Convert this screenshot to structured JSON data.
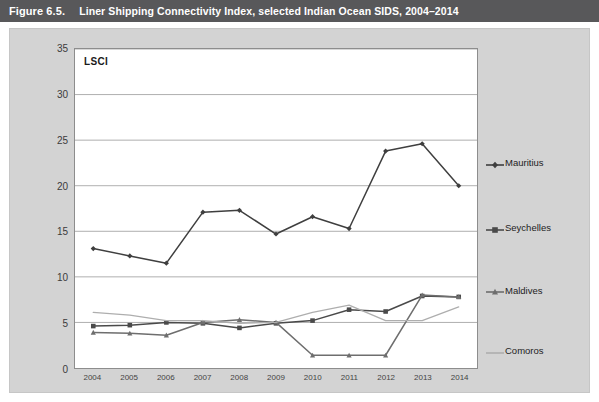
{
  "header": {
    "figure_number": "Figure 6.5.",
    "title": "Liner Shipping Connectivity Index, selected Indian Ocean SIDS, 2004–2014"
  },
  "plot": {
    "corner_label": "LSCI"
  },
  "colors": {
    "header_bar": "#58585a",
    "panel_background": "#d3d3d3",
    "plot_background": "#ffffff",
    "plot_border": "#8d8d8d",
    "gridline": "#9a9a9a",
    "mauritius": "#3f3f3f",
    "seychelles": "#4a4a4a",
    "maldives": "#6e6e6e",
    "comoros": "#aeaeae"
  },
  "chart_data": {
    "type": "line",
    "title": "Liner Shipping Connectivity Index, selected Indian Ocean SIDS, 2004–2014",
    "xlabel": "",
    "ylabel": "LSCI",
    "ylim": [
      0,
      35
    ],
    "yticks": [
      0,
      5,
      10,
      15,
      20,
      25,
      30,
      35
    ],
    "grid": true,
    "legend_position": "right-inline",
    "categories": [
      "2004",
      "2005",
      "2006",
      "2007",
      "2008",
      "2009",
      "2010",
      "2011",
      "2012",
      "2013",
      "2014"
    ],
    "series": [
      {
        "name": "Mauritius",
        "marker": "diamond",
        "values": [
          13.1,
          12.3,
          11.5,
          17.1,
          17.3,
          14.7,
          16.6,
          15.3,
          23.8,
          24.6,
          20.0
        ]
      },
      {
        "name": "Seychelles",
        "marker": "square",
        "values": [
          4.6,
          4.7,
          5.0,
          4.9,
          4.4,
          4.9,
          5.2,
          6.4,
          6.2,
          7.9,
          7.8
        ]
      },
      {
        "name": "Maldives",
        "marker": "triangle",
        "values": [
          3.9,
          3.8,
          3.6,
          5.0,
          5.3,
          5.0,
          1.4,
          1.4,
          1.4,
          8.0,
          7.8
        ]
      },
      {
        "name": "Comoros",
        "marker": "none",
        "values": [
          6.1,
          5.8,
          5.2,
          5.2,
          4.9,
          5.0,
          6.1,
          6.9,
          5.2,
          5.2,
          6.7
        ]
      }
    ]
  },
  "legend": [
    {
      "label": "Mauritius",
      "marker": "diamond",
      "anchor_value": 22.5
    },
    {
      "label": "Seychelles",
      "marker": "square",
      "anchor_value": 15.4
    },
    {
      "label": "Maldives",
      "marker": "triangle",
      "anchor_value": 8.6
    },
    {
      "label": "Comoros",
      "marker": "none",
      "anchor_value": 2.0
    }
  ]
}
